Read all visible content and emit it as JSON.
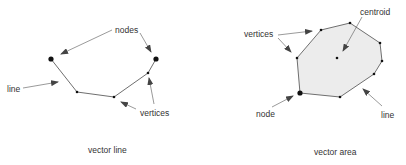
{
  "colors": {
    "line": "#6f6f6f",
    "point": "#111111",
    "arrow": "#444444",
    "area_fill": "#ececec",
    "text": "#333333"
  },
  "left_panel": {
    "caption": "vector line",
    "labels": {
      "nodes": "nodes",
      "line": "line",
      "vertices": "vertices"
    }
  },
  "right_panel": {
    "caption": "vector area",
    "labels": {
      "vertices": "vertices",
      "centroid": "centroid",
      "node": "node",
      "line": "line"
    }
  }
}
